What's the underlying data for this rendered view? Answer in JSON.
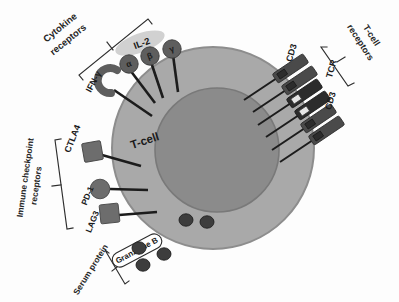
{
  "figure": {
    "cell_label": "T-cell",
    "background_color": "#fdfdfd"
  },
  "colors": {
    "cytoplasm": "#a9a9a9",
    "cytoplasm_edge": "#8f8f8f",
    "nucleus": "#8b8b8b",
    "nucleus_edge": "#7a7a7a",
    "receptor_head": "#5e5e5e",
    "checkpoint_head": "#6d6d6d",
    "bar_dark": "#2c2c2c",
    "bar_mid": "#4a4a4a",
    "bar_light": "#e6e6e6",
    "granule": "#3d3d3d",
    "stalk": "#1c1c1c",
    "label_text": "#1b1b1b",
    "il2_halo": "#c9c9c9"
  },
  "groups": {
    "cytokine": {
      "label_line1": "Cytokine",
      "label_line2": "receptors"
    },
    "tcell": {
      "label_line1": "T-cell",
      "label_line2": "receptors"
    },
    "checkpoint": {
      "label_line1": "Immune checkpoint",
      "label_line2": "receptors"
    },
    "serum": {
      "label": "Serum protein"
    }
  },
  "cytokine_receptors": [
    {
      "id": "ifng",
      "label": "IFN-γ",
      "shape": "crescent"
    },
    {
      "id": "il2-alpha",
      "label": "α",
      "shape": "circle"
    },
    {
      "id": "il2-beta",
      "label": "β",
      "shape": "circle"
    },
    {
      "id": "il2-gamma",
      "label": "γ",
      "shape": "circle"
    }
  ],
  "cytokine_complex": {
    "label": "IL-2"
  },
  "tcell_receptors": [
    {
      "id": "tcr",
      "label": "TCR"
    },
    {
      "id": "cd3-upper",
      "label": "CD3"
    },
    {
      "id": "cd3-lower",
      "label": "CD3"
    }
  ],
  "checkpoint_receptors": [
    {
      "id": "ctla4",
      "label": "CTLA4",
      "shape": "square"
    },
    {
      "id": "pd1",
      "label": "PD-1",
      "shape": "circle"
    },
    {
      "id": "lag3",
      "label": "LAG3",
      "shape": "square"
    }
  ],
  "serum_protein": {
    "label": "Granzyme B",
    "internal_granule_count": 2,
    "external_granule_count": 3
  }
}
